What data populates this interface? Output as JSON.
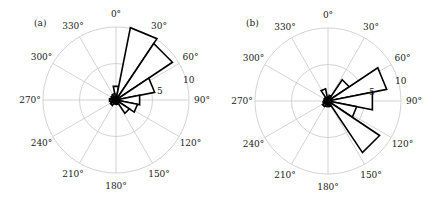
{
  "chart_data": [
    {
      "type": "rose",
      "panel_label": "(a)",
      "title": "",
      "angle_unit": "degrees",
      "direction": "clockwise from north",
      "bin_width": 22.5,
      "bin_centers": [
        0,
        22.5,
        45,
        67.5,
        90,
        112.5,
        135,
        157.5,
        180,
        202.5,
        225,
        247.5,
        270,
        292.5,
        315,
        337.5
      ],
      "values": [
        1.9,
        10.1,
        9.3,
        5.4,
        3.3,
        3.0,
        2.2,
        0.6,
        0.6,
        0.5,
        0.9,
        0.8,
        0.9,
        0.7,
        0.8,
        0.9
      ],
      "angular_tick_labels": [
        "0°",
        "30°",
        "60°",
        "90°",
        "120°",
        "150°",
        "180°",
        "210°",
        "240°",
        "270°",
        "300°",
        "330°"
      ],
      "radial_tick_labels": [
        "5",
        "10"
      ],
      "rlim": [
        0,
        10
      ],
      "grid": true
    },
    {
      "type": "rose",
      "panel_label": "(b)",
      "title": "",
      "angle_unit": "degrees",
      "direction": "clockwise from north",
      "bin_width": 22.5,
      "bin_centers": [
        0,
        22.5,
        45,
        67.5,
        90,
        112.5,
        135,
        157.5,
        180,
        202.5,
        225,
        247.5,
        270,
        292.5,
        315,
        337.5
      ],
      "values": [
        0.6,
        0.8,
        3.5,
        8.2,
        6.2,
        4.0,
        8.5,
        0.8,
        0.7,
        0.8,
        0.9,
        0.7,
        0.6,
        0.5,
        0.6,
        1.7
      ],
      "angular_tick_labels": [
        "0°",
        "30°",
        "60°",
        "90°",
        "120°",
        "150°",
        "180°",
        "210°",
        "240°",
        "270°",
        "300°",
        "330°"
      ],
      "radial_tick_labels": [
        "5",
        "10"
      ],
      "rlim": [
        0,
        10
      ],
      "grid": true
    }
  ],
  "panels": [
    {
      "label": "(a)",
      "cx": 116,
      "cy": 100,
      "radius": 73
    },
    {
      "label": "(b)",
      "cx": 328,
      "cy": 101,
      "radius": 73
    }
  ]
}
